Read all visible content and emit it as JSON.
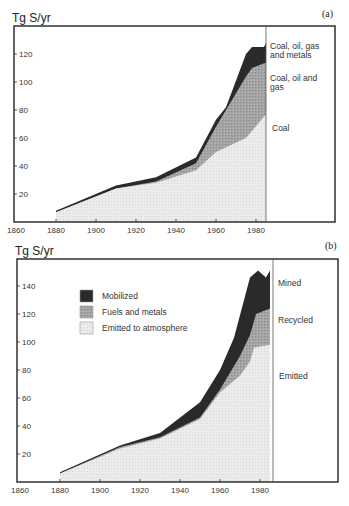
{
  "chart_data": [
    {
      "type": "area",
      "panel_label": "(a)",
      "title": "",
      "ylabel": "Tg S/yr",
      "xlabel": "",
      "x_ticks": [
        1860,
        1880,
        1900,
        1920,
        1940,
        1960,
        1980
      ],
      "y_ticks": [
        20,
        40,
        60,
        80,
        100,
        120
      ],
      "xlim": [
        1860,
        1985
      ],
      "ylim": [
        0,
        130
      ],
      "grid": false,
      "stacked": true,
      "legend": null,
      "annotations": [
        "Coal, oil, gas and metals",
        "Coal, oil and gas",
        "Coal"
      ],
      "series": [
        {
          "name": "Coal",
          "fill": "#e9e9e9",
          "x": [
            1880,
            1910,
            1930,
            1950,
            1960,
            1975,
            1985
          ],
          "values": [
            7,
            24,
            28,
            37,
            50,
            60,
            77
          ]
        },
        {
          "name": "Coal, oil and gas",
          "fill": "#9e9e9e",
          "x": [
            1880,
            1910,
            1930,
            1950,
            1960,
            1975,
            1978,
            1985
          ],
          "values": [
            7,
            24,
            29,
            42,
            68,
            104,
            110,
            114
          ]
        },
        {
          "name": "Coal, oil, gas and metals",
          "fill": "#2b2b2b",
          "x": [
            1880,
            1910,
            1930,
            1950,
            1960,
            1965,
            1975,
            1978,
            1984,
            1985
          ],
          "values": [
            8,
            26,
            32,
            46,
            73,
            82,
            120,
            125,
            125,
            128
          ]
        }
      ]
    },
    {
      "type": "area",
      "panel_label": "(b)",
      "title": "",
      "ylabel": "Tg S/yr",
      "xlabel": "",
      "x_ticks": [
        1860,
        1880,
        1900,
        1920,
        1940,
        1960,
        1980
      ],
      "y_ticks": [
        20,
        40,
        60,
        80,
        100,
        120,
        140
      ],
      "xlim": [
        1860,
        1985
      ],
      "ylim": [
        0,
        160
      ],
      "grid": false,
      "stacked": true,
      "legend": {
        "position": "upper-left",
        "entries": [
          "Mobilized",
          "Fuels and metals",
          "Emitted to atmosphere"
        ]
      },
      "annotations": [
        "Mined",
        "Recycled",
        "Emitted"
      ],
      "series": [
        {
          "name": "Emitted to atmosphere",
          "fill": "#e9e9e9",
          "x": [
            1880,
            1910,
            1930,
            1950,
            1960,
            1970,
            1975,
            1977,
            1985
          ],
          "values": [
            6,
            24,
            31,
            45,
            64,
            76,
            86,
            96,
            98
          ]
        },
        {
          "name": "Fuels and metals",
          "fill": "#9e9e9e",
          "x": [
            1880,
            1910,
            1930,
            1950,
            1960,
            1970,
            1975,
            1978,
            1985
          ],
          "values": [
            6,
            25,
            32,
            46,
            66,
            90,
            105,
            120,
            124
          ]
        },
        {
          "name": "Mobilized",
          "fill": "#2b2b2b",
          "x": [
            1880,
            1910,
            1930,
            1950,
            1960,
            1967,
            1975,
            1979,
            1983,
            1985
          ],
          "values": [
            7,
            26,
            35,
            57,
            80,
            103,
            146,
            151,
            146,
            151
          ]
        }
      ]
    }
  ]
}
